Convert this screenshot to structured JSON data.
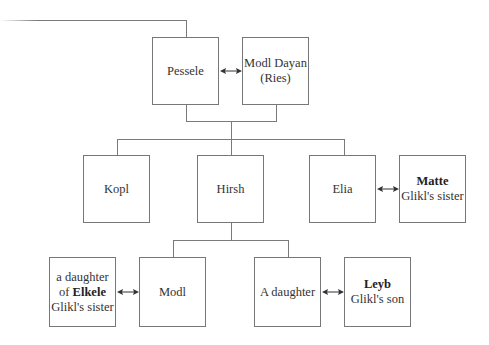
{
  "diagram": {
    "type": "family-tree",
    "generation1": {
      "pessele": {
        "label": "Pessele"
      },
      "modl_dayan": {
        "line1": "Modl Dayan",
        "line2": "(Ries)"
      }
    },
    "generation2": {
      "kopl": {
        "label": "Kopl"
      },
      "hirsh": {
        "label": "Hirsh"
      },
      "elia": {
        "label": "Elia"
      },
      "matte": {
        "name": "Matte",
        "relation": "Glikl's sister"
      }
    },
    "generation3": {
      "elkele_daughter": {
        "line1": "a daughter",
        "line2_prefix": "of ",
        "line2_name": "Elkele",
        "line3": "Glikl's sister"
      },
      "modl": {
        "label": "Modl"
      },
      "a_daughter": {
        "label": "A daughter"
      },
      "leyb": {
        "name": "Leyb",
        "relation": "Glikl's son"
      }
    },
    "colors": {
      "line": "#7a7a7a",
      "text": "#333333",
      "box_border": "#777777"
    }
  }
}
